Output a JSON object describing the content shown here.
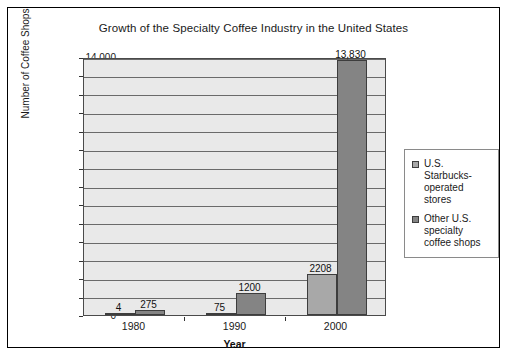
{
  "chart_data": {
    "type": "bar",
    "title": "Growth of the Specialty Coffee Industry in the United States",
    "xlabel": "Year",
    "ylabel": "Number of Coffee Shops",
    "categories": [
      "1980",
      "1990",
      "2000"
    ],
    "series": [
      {
        "name": "U.S. Starbucks-operated stores",
        "color": "#a8a8a8",
        "values": [
          4,
          75,
          2208
        ],
        "value_labels": [
          "4",
          "75",
          "2208"
        ]
      },
      {
        "name": "Other U.S. specialty coffee shops",
        "color": "#848484",
        "values": [
          275,
          1200,
          13830
        ],
        "value_labels": [
          "275",
          "1200",
          "13,830"
        ]
      }
    ],
    "ylim": [
      0,
      14000
    ],
    "ytick_values": [
      0,
      1000,
      2000,
      3000,
      4000,
      5000,
      6000,
      7000,
      8000,
      9000,
      10000,
      11000,
      12000,
      13000,
      14000
    ],
    "ytick_labels": [
      "0",
      "1,000",
      "2,000",
      "3,000",
      "4,000",
      "5,000",
      "6,000",
      "7,000",
      "8,000",
      "9,000",
      "10,000",
      "11,000",
      "12,000",
      "13,000",
      "14,000"
    ],
    "grid": true,
    "legend_position": "right",
    "legend_entries": [
      {
        "label": "U.S. Starbucks-operated stores",
        "color": "#a8a8a8"
      },
      {
        "label": "Other U.S. specialty coffee shops",
        "color": "#848484"
      }
    ],
    "plot_background": "#e9e9e9",
    "frame_border_color": "#000000"
  }
}
